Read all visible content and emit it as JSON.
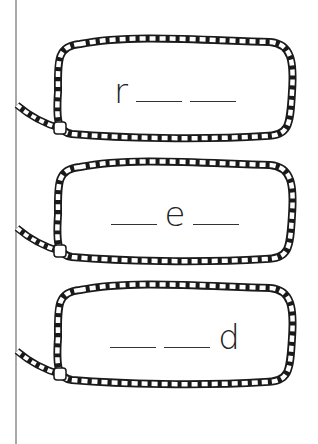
{
  "worksheet": {
    "items": [
      {
        "slots": [
          {
            "type": "letter",
            "value": "r"
          },
          {
            "type": "blank"
          },
          {
            "type": "blank"
          }
        ]
      },
      {
        "slots": [
          {
            "type": "blank"
          },
          {
            "type": "letter",
            "value": "e"
          },
          {
            "type": "blank"
          }
        ]
      },
      {
        "slots": [
          {
            "type": "blank"
          },
          {
            "type": "blank"
          },
          {
            "type": "letter",
            "value": "d"
          }
        ]
      }
    ],
    "letters": {
      "item1": "r",
      "item2": "e",
      "item3": "d"
    }
  },
  "colors": {
    "rope_outline": "#1a1a1a",
    "margin_line": "#a9a9a9",
    "text": "#222222"
  }
}
